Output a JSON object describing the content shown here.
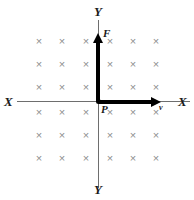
{
  "figure": {
    "background_color": "#ffffff",
    "field_mark_color": "#8e8e8e",
    "axis_color": "#6e6e6e",
    "vector_color": "#000000",
    "label_color": "#1a1a1a"
  },
  "axes": {
    "y_top_label": "Y",
    "y_bottom_label": "Y",
    "x_left_label": "X",
    "x_right_label": "X"
  },
  "points": {
    "origin_label": "P"
  },
  "vectors": [
    {
      "name": "force",
      "label": "F",
      "direction": "up",
      "from": [
        99,
        102
      ],
      "to": [
        99,
        33
      ]
    },
    {
      "name": "velocity",
      "label": "v",
      "direction": "right",
      "from": [
        99,
        102
      ],
      "to": [
        161,
        102
      ]
    }
  ],
  "field": {
    "symbol": "×",
    "meaning": "magnetic field into the page",
    "rows": 6,
    "columns": 6,
    "column_x": [
      39,
      62,
      86,
      110,
      133,
      156
    ],
    "row_y": [
      41,
      64,
      87,
      112,
      135,
      158
    ],
    "marks": [
      {
        "x": 39,
        "y": 41
      },
      {
        "x": 62,
        "y": 41
      },
      {
        "x": 86,
        "y": 41
      },
      {
        "x": 110,
        "y": 41
      },
      {
        "x": 133,
        "y": 41
      },
      {
        "x": 156,
        "y": 41
      },
      {
        "x": 39,
        "y": 64
      },
      {
        "x": 62,
        "y": 64
      },
      {
        "x": 86,
        "y": 64
      },
      {
        "x": 110,
        "y": 64
      },
      {
        "x": 133,
        "y": 64
      },
      {
        "x": 156,
        "y": 64
      },
      {
        "x": 39,
        "y": 87
      },
      {
        "x": 62,
        "y": 87
      },
      {
        "x": 86,
        "y": 87
      },
      {
        "x": 110,
        "y": 87
      },
      {
        "x": 133,
        "y": 87
      },
      {
        "x": 156,
        "y": 87
      },
      {
        "x": 39,
        "y": 112
      },
      {
        "x": 62,
        "y": 112
      },
      {
        "x": 86,
        "y": 112
      },
      {
        "x": 110,
        "y": 112
      },
      {
        "x": 133,
        "y": 112
      },
      {
        "x": 156,
        "y": 112
      },
      {
        "x": 39,
        "y": 135
      },
      {
        "x": 62,
        "y": 135
      },
      {
        "x": 86,
        "y": 135
      },
      {
        "x": 110,
        "y": 135
      },
      {
        "x": 133,
        "y": 135
      },
      {
        "x": 156,
        "y": 135
      },
      {
        "x": 39,
        "y": 158
      },
      {
        "x": 62,
        "y": 158
      },
      {
        "x": 86,
        "y": 158
      },
      {
        "x": 110,
        "y": 158
      },
      {
        "x": 133,
        "y": 158
      },
      {
        "x": 156,
        "y": 158
      }
    ]
  }
}
